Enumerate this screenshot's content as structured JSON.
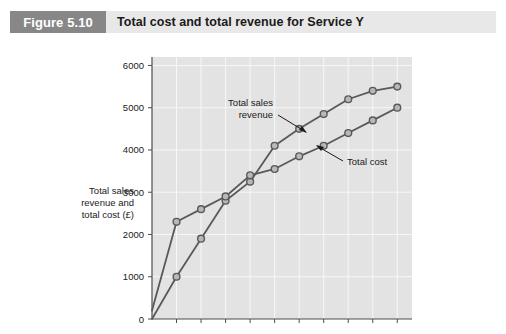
{
  "figure": {
    "badge_label": "Figure 5.10",
    "title": "Total cost and total revenue for Service Y",
    "badge_color": "#878787",
    "header_bg": "#e8e8e8"
  },
  "chart_data": {
    "type": "line",
    "title": "Total cost and total revenue for Service Y",
    "xlabel": "Units of Service Y",
    "ylabel": "Total sales revenue and total cost (£)",
    "xlim": [
      0,
      10.6
    ],
    "ylim": [
      0,
      6200
    ],
    "xticks": [
      1,
      2,
      3,
      4,
      5,
      6,
      7,
      8,
      9,
      10
    ],
    "xtick_labels": [
      "1",
      "2",
      "3",
      "4",
      "5",
      "6",
      "7",
      "8",
      "9",
      "10"
    ],
    "yticks": [
      0,
      1000,
      2000,
      3000,
      4000,
      5000,
      6000
    ],
    "ytick_labels": [
      "0",
      "1000",
      "2000",
      "3000",
      "4000",
      "5000",
      "6000"
    ],
    "grid": true,
    "legend": "annotations",
    "plot_bg": "#e3e3e3",
    "grid_color": "#f7f7f7",
    "line_color": "#595959",
    "marker_fill": "#b8b8b8",
    "x": [
      0,
      1,
      2,
      3,
      4,
      5,
      6,
      7,
      8,
      9,
      10
    ],
    "series": [
      {
        "name": "Total sales revenue",
        "values": [
          0,
          1000,
          1900,
          2800,
          3250,
          4100,
          4500,
          4850,
          5200,
          5400,
          5500
        ]
      },
      {
        "name": "Total cost",
        "values": [
          200,
          2300,
          2600,
          2900,
          3400,
          3550,
          3850,
          4100,
          4400,
          4700,
          5000
        ]
      }
    ],
    "annotations": [
      {
        "text_line1": "Total sales",
        "text_line2": "revenue",
        "target_series": "Total sales revenue"
      },
      {
        "text_line1": "Total cost",
        "text_line2": "",
        "target_series": "Total cost"
      }
    ]
  }
}
